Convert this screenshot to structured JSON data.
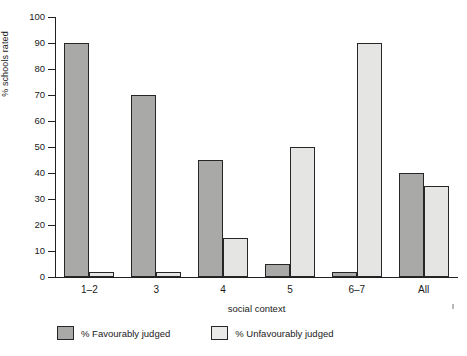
{
  "chart_data": {
    "type": "bar",
    "title": "",
    "subtitle": "",
    "xlabel": "social context",
    "ylabel": "% schools rated",
    "categories": [
      "1–2",
      "3",
      "4",
      "5",
      "6–7",
      "All"
    ],
    "series": [
      {
        "name": "% Favourably judged",
        "color": "#a9a9a7",
        "values": [
          90,
          70,
          45,
          5,
          2,
          40
        ]
      },
      {
        "name": "% Unfavourably judged",
        "color": "#e5e5e3",
        "values": [
          2,
          2,
          15,
          50,
          90,
          35
        ]
      }
    ],
    "ylim": [
      0,
      100
    ],
    "yticks": [
      0,
      10,
      20,
      30,
      40,
      50,
      60,
      70,
      80,
      90,
      100
    ],
    "ytick_labels": [
      "0",
      "10",
      "20",
      "30",
      "40",
      "50",
      "60",
      "70",
      "80",
      "90",
      "100"
    ],
    "grid": false,
    "legend_position": "bottom-left",
    "legend": [
      "% Favourably judged",
      "% Unfavourably judged"
    ]
  },
  "axes": {
    "y_label": "% schools rated",
    "x_label": "social context"
  },
  "legend": {
    "items": [
      {
        "label": "% Favourably judged",
        "color": "#a9a9a7"
      },
      {
        "label": "% Unfavourably judged",
        "color": "#e9e9e7"
      }
    ]
  }
}
